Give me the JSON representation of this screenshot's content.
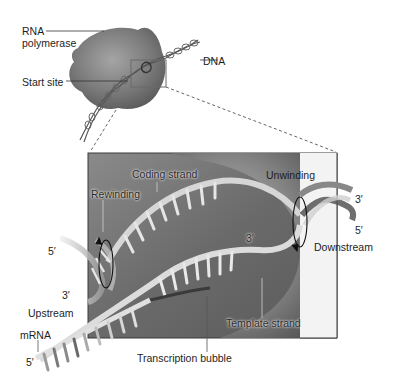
{
  "figure": {
    "overview": {
      "labels": {
        "rna_polymerase_line1": "RNA",
        "rna_polymerase_line2": "polymerase",
        "dna": "DNA",
        "start_site": "Start site"
      }
    },
    "detail": {
      "labels": {
        "coding_strand": "Coding strand",
        "rewinding": "Rewinding",
        "unwinding": "Unwinding",
        "template_strand": "Template strand",
        "transcription_bubble": "Transcription bubble",
        "downstream": "Downstream",
        "upstream": "Upstream",
        "mrna": "mRNA"
      },
      "ends": {
        "right_top": "3′",
        "right_bottom": "5′",
        "left_top": "5′",
        "left_bottom": "3′",
        "rna_3prime": "3′",
        "mrna_5prime": "5′"
      }
    },
    "colors": {
      "background": "#ffffff",
      "polymerase": "#7a7a7a",
      "panel": "#6e6e6e",
      "strand": "#d8d8d8",
      "leader_line": "#333333"
    }
  }
}
